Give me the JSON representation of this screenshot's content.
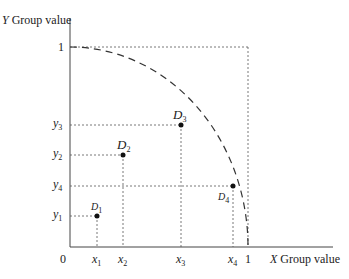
{
  "diagram": {
    "y_axis_label": {
      "var": "Y",
      "text": " Group value"
    },
    "x_axis_label": {
      "var": "X",
      "text": " Group value"
    },
    "origin_label": "0",
    "x_one_label": "1",
    "y_one_label": "1",
    "points": [
      {
        "name": "D",
        "sub": "1",
        "x_label": "x",
        "x_sub": "1",
        "y_label": "y",
        "y_sub": "1"
      },
      {
        "name": "D",
        "sub": "2",
        "x_label": "x",
        "x_sub": "2",
        "y_label": "y",
        "y_sub": "2"
      },
      {
        "name": "D",
        "sub": "3",
        "x_label": "x",
        "x_sub": "3",
        "y_label": "y",
        "y_sub": "3"
      },
      {
        "name": "D",
        "sub": "4",
        "x_label": "x",
        "x_sub": "4",
        "y_label": "y",
        "y_sub": "4"
      }
    ],
    "curve": "dashed quarter-circle frontier from (0,1) to (1,0)",
    "colors": {
      "line": "#333333",
      "dash": "#555555"
    }
  }
}
